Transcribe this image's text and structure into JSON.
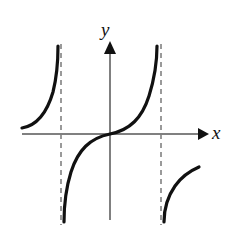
{
  "figure": {
    "name": "tangent-function-graph",
    "background_color": "#ffffff",
    "width": 241,
    "height": 234
  },
  "axes": {
    "x_label": "x",
    "y_label": "y",
    "color": "#808080",
    "stroke_width": 2,
    "origin": {
      "x": 110,
      "y": 134
    },
    "x_axis": {
      "start_x": 22,
      "end_x": 207,
      "y": 134,
      "arrow": "right"
    },
    "y_axis": {
      "x": 110,
      "start_y": 220,
      "end_y": 42,
      "arrow": "up"
    }
  },
  "asymptotes": {
    "color": "#9a9a9a",
    "stroke_width": 2,
    "dash": "5,4",
    "lines": [
      {
        "x": 61,
        "y_top": 44,
        "y_bottom": 225
      },
      {
        "x": 161,
        "y_top": 44,
        "y_bottom": 225
      }
    ]
  },
  "curve": {
    "color": "#111111",
    "stroke_width": 3.2,
    "branches": [
      "M22,128 C34,126 46,116 53,92 C57,76 58,60 58,46",
      "M64,222 C64,206 66,188 71,172 C78,150 90,138 110,134 C130,130 142,118 149,96 C154,80 157,62 157,46",
      "M164,222 C164,208 168,196 175,186 C182,176 192,170 199,167"
    ]
  }
}
